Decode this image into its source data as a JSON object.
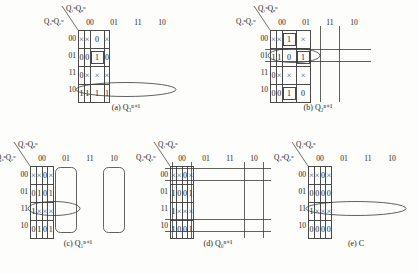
{
  "figure": {
    "axis_top_label": "Q₁ⁿQ₀ⁿ",
    "axis_left_label": "Q₃ⁿQ₂ⁿ",
    "col_headers": [
      "00",
      "01",
      "11",
      "10"
    ],
    "row_headers": [
      "00",
      "01",
      "11",
      "10"
    ],
    "symbols": {
      "dontcare": "×",
      "one": "1",
      "zero": "0"
    }
  },
  "maps": [
    {
      "id": "a",
      "caption": "(a) Q₃ⁿ⁺¹",
      "cells": [
        [
          "×",
          "×",
          "0",
          "×"
        ],
        [
          "0",
          "0",
          "1",
          "0"
        ],
        [
          "0",
          "×",
          "×",
          "×"
        ],
        [
          "1",
          "1",
          "1",
          "1"
        ]
      ],
      "boxed": [
        [
          1,
          2
        ]
      ],
      "loops": [
        {
          "shape": "ellipse",
          "row": 3,
          "col_start": 0,
          "col_span": 4
        }
      ]
    },
    {
      "id": "b",
      "caption": "(b) Q₂ⁿ⁺¹",
      "cells": [
        [
          "×",
          "×",
          "1",
          "×"
        ],
        [
          "1",
          "1",
          "0",
          "1"
        ],
        [
          "0",
          "×",
          "×",
          "×"
        ],
        [
          "0",
          "0",
          "1",
          "0"
        ]
      ],
      "boxed": [
        [
          0,
          2
        ],
        [
          1,
          3
        ],
        [
          3,
          2
        ]
      ],
      "loops": [
        {
          "shape": "ellipse",
          "row": 1,
          "col_start": 0,
          "col_span": 2
        },
        {
          "shape": "vwrap",
          "col": 2
        },
        {
          "shape": "hwrap",
          "row": 1
        }
      ]
    },
    {
      "id": "c",
      "caption": "(c) Q₁ⁿ⁺¹",
      "cells": [
        [
          "×",
          "×",
          "0",
          "×"
        ],
        [
          "0",
          "1",
          "0",
          "1"
        ],
        [
          "1",
          "×",
          "×",
          "×"
        ],
        [
          "0",
          "1",
          "0",
          "1"
        ]
      ],
      "boxed": [],
      "loops": [
        {
          "shape": "vcol",
          "col": 1
        },
        {
          "shape": "vcol",
          "col": 3
        },
        {
          "shape": "ellipse",
          "row": 2,
          "col_start": 0,
          "col_span": 2
        }
      ]
    },
    {
      "id": "d",
      "caption": "(d) Q₀ⁿ⁺¹",
      "cells": [
        [
          "×",
          "×",
          "0",
          "×"
        ],
        [
          "1",
          "0",
          "0",
          "1"
        ],
        [
          "1",
          "×",
          "×",
          "×"
        ],
        [
          "1",
          "0",
          "0",
          "1"
        ]
      ],
      "boxed": [],
      "loops": [
        {
          "shape": "vwrap",
          "col": 0
        },
        {
          "shape": "vwrap",
          "col": 3
        },
        {
          "shape": "hwrap",
          "row": 0
        },
        {
          "shape": "hwrap",
          "row": 3
        }
      ]
    },
    {
      "id": "e",
      "caption": "(e) C",
      "cells": [
        [
          "×",
          "×",
          "0",
          "×"
        ],
        [
          "0",
          "0",
          "0",
          "0"
        ],
        [
          "1",
          "×",
          "×",
          "×"
        ],
        [
          "0",
          "0",
          "0",
          "0"
        ]
      ],
      "boxed": [],
      "loops": [
        {
          "shape": "ellipse",
          "row": 2,
          "col_start": 0,
          "col_span": 4
        }
      ]
    }
  ],
  "layout": {
    "positions": [
      {
        "id": "a",
        "x": 60,
        "y": 4
      },
      {
        "id": "b",
        "x": 252,
        "y": 4
      },
      {
        "id": "c",
        "x": 12,
        "y": 140
      },
      {
        "id": "d",
        "x": 152,
        "y": 140
      },
      {
        "id": "e",
        "x": 290,
        "y": 140
      }
    ]
  },
  "colors": {
    "grid_line": "#4a4a4a",
    "loop_stroke": "#3a3a3a",
    "text": "#1a1a1a",
    "background": "#fdfdfb"
  }
}
